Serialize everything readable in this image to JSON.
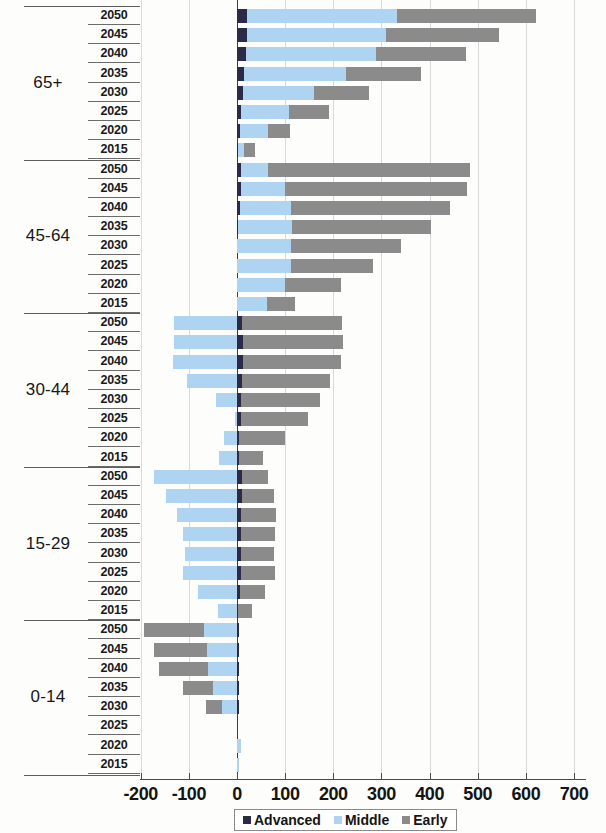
{
  "chart_data": {
    "type": "bar",
    "title": "",
    "subtitle": "",
    "xlabel": "",
    "ylabel": "",
    "orientation": "horizontal",
    "stacked": true,
    "grid": false,
    "xlim": [
      -200,
      700
    ],
    "xticks": [
      -200,
      -100,
      0,
      100,
      200,
      300,
      400,
      500,
      600,
      700
    ],
    "xtick_labels": [
      "-200",
      "-100",
      "0",
      "100",
      "200",
      "300",
      "400",
      "500",
      "600",
      "700"
    ],
    "legend": {
      "position": "bottom",
      "entries": [
        {
          "name": "Advanced",
          "color": "#2b2b48"
        },
        {
          "name": "Middle",
          "color": "#aed4f2"
        },
        {
          "name": "Early",
          "color": "#8b8b8b"
        }
      ]
    },
    "series_names": [
      "Advanced",
      "Middle",
      "Early"
    ],
    "groups": [
      {
        "label": "65+",
        "rows": [
          {
            "year": "2050",
            "Advanced": 21,
            "Middle": 312,
            "Early": 287
          },
          {
            "year": "2045",
            "Advanced": 20,
            "Middle": 290,
            "Early": 235
          },
          {
            "year": "2040",
            "Advanced": 18,
            "Middle": 270,
            "Early": 188
          },
          {
            "year": "2035",
            "Advanced": 15,
            "Middle": 212,
            "Early": 155
          },
          {
            "year": "2030",
            "Advanced": 12,
            "Middle": 148,
            "Early": 115
          },
          {
            "year": "2025",
            "Advanced": 9,
            "Middle": 100,
            "Early": 82
          },
          {
            "year": "2020",
            "Advanced": 6,
            "Middle": 58,
            "Early": 47
          },
          {
            "year": "2015",
            "Advanced": 3,
            "Middle": 11,
            "Early": 23
          }
        ]
      },
      {
        "label": "45-64",
        "rows": [
          {
            "year": "2050",
            "Advanced": 9,
            "Middle": 56,
            "Early": 418
          },
          {
            "year": "2045",
            "Advanced": 8,
            "Middle": 92,
            "Early": 378
          },
          {
            "year": "2040",
            "Advanced": 7,
            "Middle": 105,
            "Early": 330
          },
          {
            "year": "2035",
            "Advanced": 3,
            "Middle": 112,
            "Early": 287
          },
          {
            "year": "2030",
            "Advanced": 1,
            "Middle": 112,
            "Early": 227
          },
          {
            "year": "2025",
            "Advanced": 0,
            "Middle": 113,
            "Early": 170
          },
          {
            "year": "2020",
            "Advanced": 0,
            "Middle": 100,
            "Early": 115
          },
          {
            "year": "2015",
            "Advanced": 0,
            "Middle": 62,
            "Early": 58
          }
        ]
      },
      {
        "label": "30-44",
        "rows": [
          {
            "year": "2050",
            "Advanced": 11,
            "Middle": -131,
            "Early": 207
          },
          {
            "year": "2045",
            "Advanced": 12,
            "Middle": -130,
            "Early": 208
          },
          {
            "year": "2040",
            "Advanced": 12,
            "Middle": -132,
            "Early": 203
          },
          {
            "year": "2035",
            "Advanced": 10,
            "Middle": -104,
            "Early": 183
          },
          {
            "year": "2030",
            "Advanced": 9,
            "Middle": -44,
            "Early": 164
          },
          {
            "year": "2025",
            "Advanced": 8,
            "Middle": -5,
            "Early": 140
          },
          {
            "year": "2020",
            "Advanced": 5,
            "Middle": -28,
            "Early": 95
          },
          {
            "year": "2015",
            "Advanced": 4,
            "Middle": -38,
            "Early": 50
          }
        ]
      },
      {
        "label": "15-29",
        "rows": [
          {
            "year": "2050",
            "Advanced": 10,
            "Middle": -173,
            "Early": 55
          },
          {
            "year": "2045",
            "Advanced": 10,
            "Middle": -147,
            "Early": 67
          },
          {
            "year": "2040",
            "Advanced": 9,
            "Middle": -125,
            "Early": 72
          },
          {
            "year": "2035",
            "Advanced": 9,
            "Middle": -113,
            "Early": 70
          },
          {
            "year": "2030",
            "Advanced": 8,
            "Middle": -108,
            "Early": 68
          },
          {
            "year": "2025",
            "Advanced": 8,
            "Middle": -112,
            "Early": 70
          },
          {
            "year": "2020",
            "Advanced": 6,
            "Middle": -80,
            "Early": 52
          },
          {
            "year": "2015",
            "Advanced": 3,
            "Middle": -40,
            "Early": 28
          }
        ]
      },
      {
        "label": "0-14",
        "rows": [
          {
            "year": "2050",
            "Advanced": 2,
            "Middle": -69,
            "Early": -125
          },
          {
            "year": "2045",
            "Advanced": 2,
            "Middle": -62,
            "Early": -110
          },
          {
            "year": "2040",
            "Advanced": 2,
            "Middle": -60,
            "Early": -103
          },
          {
            "year": "2035",
            "Advanced": 1,
            "Middle": -50,
            "Early": -62
          },
          {
            "year": "2030",
            "Advanced": 1,
            "Middle": -31,
            "Early": -33
          },
          {
            "year": "2025",
            "Advanced": 0,
            "Middle": 0,
            "Early": 0
          },
          {
            "year": "2020",
            "Advanced": 1,
            "Middle": 8,
            "Early": 0
          },
          {
            "year": "2015",
            "Advanced": 1,
            "Middle": 3,
            "Early": 0
          }
        ]
      }
    ]
  }
}
